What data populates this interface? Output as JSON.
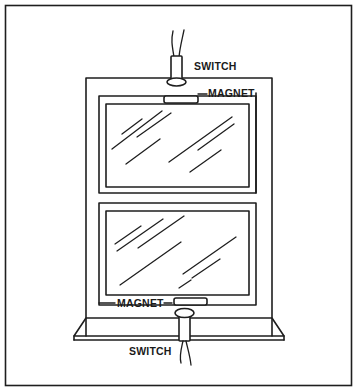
{
  "figure": {
    "labels": {
      "top_switch": "SWITCH",
      "top_magnet": "MAGNET",
      "bottom_magnet": "MAGNET",
      "bottom_switch": "SWITCH"
    },
    "components": [
      {
        "name": "top-switch",
        "type": "magnetic reed switch",
        "position": "head of window frame"
      },
      {
        "name": "top-magnet",
        "type": "magnet",
        "position": "top of upper sash"
      },
      {
        "name": "bottom-magnet",
        "type": "magnet",
        "position": "bottom of lower sash"
      },
      {
        "name": "bottom-switch",
        "type": "magnetic reed switch",
        "position": "window sill"
      }
    ],
    "colors": {
      "line": "#1e1e1e",
      "background": "#ffffff"
    }
  }
}
